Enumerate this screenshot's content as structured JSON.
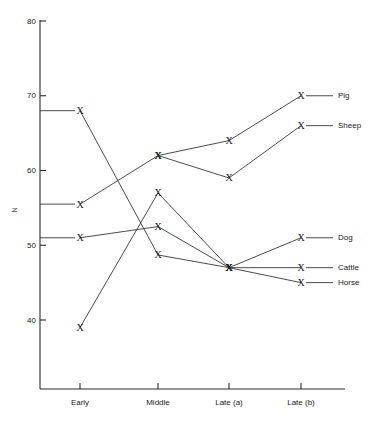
{
  "chart_data": {
    "type": "line",
    "title": "",
    "subtitle": "",
    "xlabel": "",
    "ylabel": "N",
    "categories": [
      "Early",
      "Middle",
      "Late (a)",
      "Late (b)"
    ],
    "ylim": [
      40,
      80
    ],
    "yticks": [
      40,
      50,
      60,
      70,
      80
    ],
    "ytick_labels": [
      "40",
      "50",
      "60",
      "70",
      "80"
    ],
    "grid": false,
    "legend_position": "right-inline-labels",
    "marker": "X",
    "series": [
      {
        "name": "Pig",
        "label": "Pig",
        "x": [
          "Early",
          "Middle",
          "Late (a)",
          "Late (b)"
        ],
        "values": [
          55.5,
          62,
          64,
          70
        ]
      },
      {
        "name": "Sheep",
        "label": "Sheep",
        "x": [
          "Middle",
          "Late (a)",
          "Late (b)"
        ],
        "values": [
          62,
          59,
          66
        ]
      },
      {
        "name": "Dog",
        "label": "Dog",
        "x": [
          "Early",
          "Middle",
          "Late (a)",
          "Late (b)"
        ],
        "values": [
          51,
          52.5,
          47,
          51
        ]
      },
      {
        "name": "Cattle",
        "label": "Cattle",
        "x": [
          "Early",
          "Middle",
          "Late (a)",
          "Late (b)"
        ],
        "values": [
          39,
          57,
          47,
          47
        ]
      },
      {
        "name": "Horse",
        "label": "Horse",
        "x": [
          "Early",
          "Middle",
          "Late (a)",
          "Late (b)"
        ],
        "values": [
          68,
          48.7,
          47,
          45
        ]
      }
    ],
    "label_anchors": [
      {
        "name": "Pig",
        "value": 70,
        "category": "Late (b)"
      },
      {
        "name": "Sheep",
        "value": 66,
        "category": "Late (b)"
      },
      {
        "name": "Dog",
        "value": 51,
        "category": "Late (b)"
      },
      {
        "name": "Cattle",
        "value": 47,
        "category": "Late (b)"
      },
      {
        "name": "Horse",
        "value": 45,
        "category": "Late (b)"
      }
    ],
    "colors": {
      "line": "#2b2b2b",
      "axis": "#2b2b2b",
      "text": "#1a1a1a",
      "background": "#ffffff"
    }
  }
}
